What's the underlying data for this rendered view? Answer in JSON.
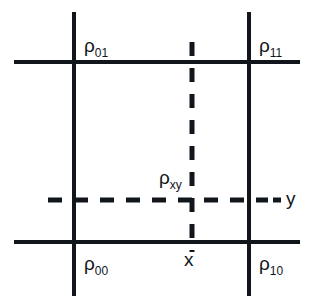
{
  "figure": {
    "background_color": "#ffffff",
    "line_color": "#11151c",
    "text_color": "#11151c"
  },
  "labels": {
    "rho_01": {
      "base": "ρ",
      "sub": "01"
    },
    "rho_11": {
      "base": "ρ",
      "sub": "11"
    },
    "rho_00": {
      "base": "ρ",
      "sub": "00"
    },
    "rho_10": {
      "base": "ρ",
      "sub": "10"
    },
    "rho_xy": {
      "base": "ρ",
      "sub": "xy"
    },
    "axis_x": "x",
    "axis_y": "y"
  },
  "geometry": {
    "solid_vertical_left_x": 74,
    "solid_vertical_right_x": 249,
    "solid_horizontal_top_y": 62,
    "solid_horizontal_bottom_y": 242,
    "dashed_vertical_x": 192,
    "dashed_horizontal_y": 200,
    "vertical_line_top": 12,
    "vertical_line_bottom": 296,
    "horizontal_line_left": 14,
    "horizontal_line_right": 300,
    "dashed_horizontal_left": 48,
    "dashed_horizontal_right": 280,
    "dashed_vertical_top": 42,
    "dashed_vertical_bottom": 252,
    "solid_stroke_width": 4,
    "dashed_stroke_width": 5,
    "dash_pattern": "14 12"
  }
}
